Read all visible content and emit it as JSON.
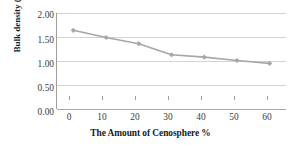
{
  "chart_data": {
    "type": "line",
    "title": "",
    "subtitle": "",
    "xlabel": "The Amount of Cenosphere %",
    "ylabel": "Bulk density (g/cc)",
    "x": [
      0,
      10,
      20,
      30,
      40,
      50,
      60
    ],
    "values": [
      1.64,
      1.49,
      1.36,
      1.13,
      1.08,
      1.01,
      0.95
    ],
    "series": [
      {
        "name": "Bulk density",
        "values": [
          1.64,
          1.49,
          1.36,
          1.13,
          1.08,
          1.01,
          0.95
        ]
      }
    ],
    "xtick_labels": [
      "0",
      "10",
      "20",
      "30",
      "40",
      "50",
      "60"
    ],
    "ytick_labels": [
      "0.00",
      "0.50",
      "1.00",
      "1.50",
      "2.00"
    ],
    "ytick_values": [
      0.0,
      0.5,
      1.0,
      1.5,
      2.0
    ],
    "xlim": [
      -5,
      65
    ],
    "ylim": [
      0.0,
      2.0
    ],
    "grid": "horizontal",
    "legend": "none",
    "line_color": "#a6a6a6",
    "marker": "diamond",
    "marker_color": "#a6a6a6",
    "gridline_color": "#d3d3d3",
    "axis_color": "#9f9f9f",
    "background": "#ffffff"
  }
}
